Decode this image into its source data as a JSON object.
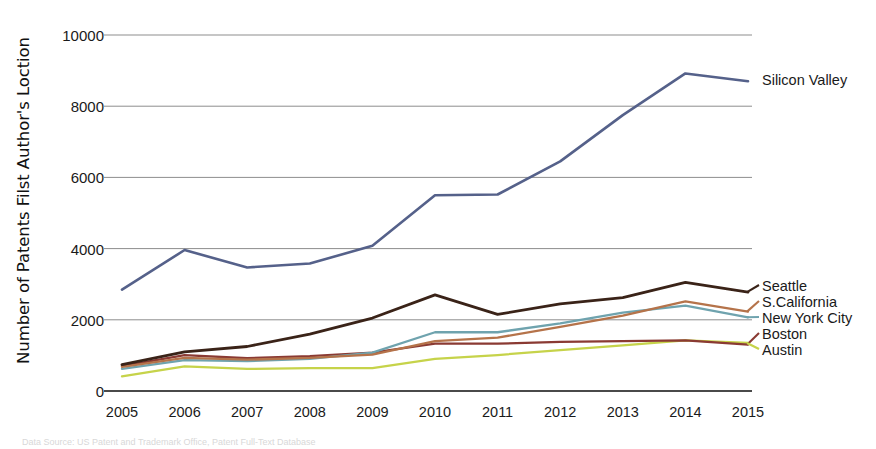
{
  "chart_data": {
    "type": "line",
    "title": "",
    "xlabel": "",
    "ylabel": "Number of Patents Filst Author's Loction",
    "categories": [
      "2005",
      "2006",
      "2007",
      "2008",
      "2009",
      "2010",
      "2011",
      "2012",
      "2013",
      "2014",
      "2015"
    ],
    "ylim": [
      0,
      10000
    ],
    "xlim": [
      "2005",
      "2015"
    ],
    "ytick_labels": [
      "0",
      "2000",
      "4000",
      "6000",
      "8000",
      "10000"
    ],
    "ytick_values": [
      0,
      2000,
      4000,
      6000,
      8000,
      10000
    ],
    "grid": "horizontal",
    "legend_position": "right-inline",
    "caption": "Data Source: US Patent and Trademark Office, Patent Full-Text Database",
    "series": [
      {
        "name": "Silicon Valley",
        "color": "#55618a",
        "values": [
          2850,
          3960,
          3470,
          3580,
          4080,
          5500,
          5520,
          6450,
          7750,
          8920,
          8700
        ]
      },
      {
        "name": "Seattle",
        "color": "#3a2318",
        "values": [
          740,
          1100,
          1250,
          1600,
          2050,
          2700,
          2150,
          2450,
          2620,
          3050,
          2780
        ]
      },
      {
        "name": "S.California",
        "color": "#b5734a",
        "values": [
          680,
          930,
          880,
          930,
          1020,
          1400,
          1500,
          1800,
          2120,
          2520,
          2230
        ]
      },
      {
        "name": "New York City",
        "color": "#6fa3ae",
        "values": [
          620,
          870,
          840,
          900,
          1080,
          1650,
          1650,
          1900,
          2200,
          2400,
          2070
        ]
      },
      {
        "name": "Boston",
        "color": "#8a3a33",
        "values": [
          700,
          1010,
          920,
          980,
          1080,
          1330,
          1330,
          1380,
          1400,
          1420,
          1300
        ]
      },
      {
        "name": "Austin",
        "color": "#c6d34a",
        "values": [
          410,
          690,
          620,
          640,
          640,
          900,
          1010,
          1150,
          1280,
          1420,
          1350
        ]
      }
    ]
  }
}
